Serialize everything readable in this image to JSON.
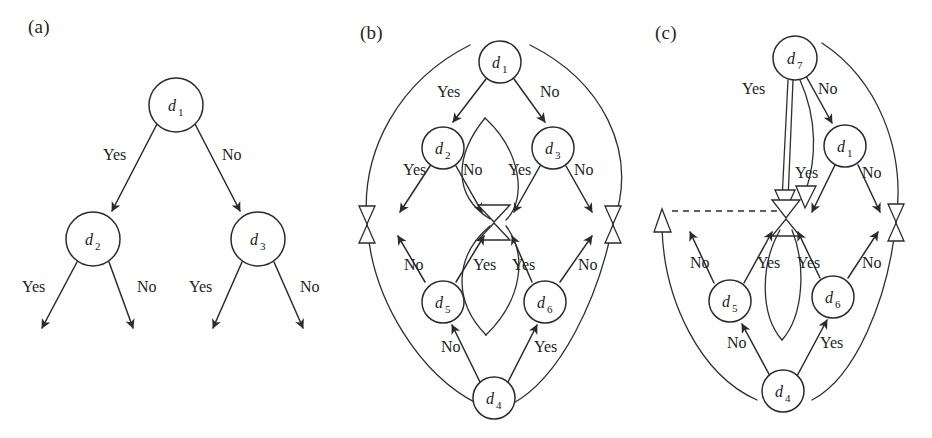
{
  "figure": {
    "background": "#fefefe",
    "stroke_color": "#2b2b2b",
    "text_color": "#1a1a1a",
    "width": 932,
    "height": 438
  },
  "panels": [
    {
      "id": "a",
      "label": "(a)",
      "label_pos": {
        "x": 28,
        "y": 16
      },
      "type": "decision-tree",
      "nodes": [
        {
          "id": "d1",
          "base": "d",
          "sub": "1",
          "cx": 176,
          "cy": 105,
          "r": 27
        },
        {
          "id": "d2",
          "base": "d",
          "sub": "2",
          "cx": 93,
          "cy": 239,
          "r": 27
        },
        {
          "id": "d3",
          "base": "d",
          "sub": "3",
          "cx": 258,
          "cy": 239,
          "r": 27
        }
      ],
      "edges": [
        {
          "from": "d1",
          "to": "d2",
          "label": "Yes",
          "label_pos": {
            "x": 103,
            "y": 160
          }
        },
        {
          "from": "d1",
          "to": "d3",
          "label": "No",
          "label_pos": {
            "x": 222,
            "y": 160
          }
        },
        {
          "from": "d2",
          "to": "leaf1",
          "label": "Yes",
          "label_pos": {
            "x": 22,
            "y": 292
          }
        },
        {
          "from": "d2",
          "to": "leaf2",
          "label": "No",
          "label_pos": {
            "x": 137,
            "y": 292
          }
        },
        {
          "from": "d3",
          "to": "leaf3",
          "label": "Yes",
          "label_pos": {
            "x": 189,
            "y": 292
          }
        },
        {
          "from": "d3",
          "to": "leaf4",
          "label": "No",
          "label_pos": {
            "x": 300,
            "y": 292
          }
        }
      ]
    },
    {
      "id": "b",
      "label": "(b)",
      "label_pos": {
        "x": 360,
        "y": 22
      },
      "type": "feedback-graph",
      "nodes": [
        {
          "id": "d1",
          "base": "d",
          "sub": "1",
          "cx": 500,
          "cy": 62,
          "r": 21
        },
        {
          "id": "d2",
          "base": "d",
          "sub": "2",
          "cx": 443,
          "cy": 148,
          "r": 21
        },
        {
          "id": "d3",
          "base": "d",
          "sub": "3",
          "cx": 553,
          "cy": 148,
          "r": 21
        },
        {
          "id": "d5",
          "base": "d",
          "sub": "5",
          "cx": 443,
          "cy": 302,
          "r": 21
        },
        {
          "id": "d6",
          "base": "d",
          "sub": "6",
          "cx": 545,
          "cy": 302,
          "r": 21
        },
        {
          "id": "d4",
          "base": "d",
          "sub": "4",
          "cx": 494,
          "cy": 398,
          "r": 21
        }
      ],
      "edge_labels": [
        {
          "text": "Yes",
          "x": 437,
          "y": 97
        },
        {
          "text": "No",
          "x": 540,
          "y": 97
        },
        {
          "text": "Yes",
          "x": 403,
          "y": 175
        },
        {
          "text": "No",
          "x": 463,
          "y": 175
        },
        {
          "text": "Yes",
          "x": 508,
          "y": 175
        },
        {
          "text": "No",
          "x": 574,
          "y": 175
        },
        {
          "text": "No",
          "x": 404,
          "y": 270
        },
        {
          "text": "Yes",
          "x": 473,
          "y": 270
        },
        {
          "text": "Yes",
          "x": 512,
          "y": 270
        },
        {
          "text": "No",
          "x": 578,
          "y": 270
        },
        {
          "text": "No",
          "x": 441,
          "y": 352
        },
        {
          "text": "Yes",
          "x": 534,
          "y": 352
        }
      ],
      "markers": [
        {
          "type": "bowtie",
          "x": 367,
          "y": 224
        },
        {
          "type": "bowtie",
          "x": 613,
          "y": 224
        }
      ],
      "hub": {
        "x": 498,
        "y": 222
      }
    },
    {
      "id": "c",
      "label": "(c)",
      "label_pos": {
        "x": 655,
        "y": 22
      },
      "type": "feedback-graph-rewired",
      "nodes": [
        {
          "id": "d7",
          "base": "d",
          "sub": "7",
          "cx": 795,
          "cy": 58,
          "r": 22
        },
        {
          "id": "d1",
          "base": "d",
          "sub": "1",
          "cx": 845,
          "cy": 146,
          "r": 21
        },
        {
          "id": "d5",
          "base": "d",
          "sub": "5",
          "cx": 730,
          "cy": 301,
          "r": 21
        },
        {
          "id": "d6",
          "base": "d",
          "sub": "6",
          "cx": 833,
          "cy": 297,
          "r": 21
        },
        {
          "id": "d4",
          "base": "d",
          "sub": "4",
          "cx": 783,
          "cy": 391,
          "r": 21
        }
      ],
      "edge_labels": [
        {
          "text": "Yes",
          "x": 742,
          "y": 94
        },
        {
          "text": "No",
          "x": 818,
          "y": 94
        },
        {
          "text": "Yes",
          "x": 795,
          "y": 178
        },
        {
          "text": "No",
          "x": 862,
          "y": 178
        },
        {
          "text": "No",
          "x": 690,
          "y": 268
        },
        {
          "text": "Yes",
          "x": 757,
          "y": 268
        },
        {
          "text": "Yes",
          "x": 797,
          "y": 268
        },
        {
          "text": "No",
          "x": 862,
          "y": 268
        },
        {
          "text": "No",
          "x": 727,
          "y": 348
        },
        {
          "text": "Yes",
          "x": 820,
          "y": 348
        }
      ],
      "markers": [
        {
          "type": "triangle-up",
          "x": 662,
          "y": 218
        },
        {
          "type": "bowtie",
          "x": 896,
          "y": 222
        }
      ],
      "hub": {
        "x": 785,
        "y": 218
      },
      "dashed_line": {
        "x1": 666,
        "y1": 211,
        "x2": 783,
        "y2": 211
      }
    }
  ]
}
